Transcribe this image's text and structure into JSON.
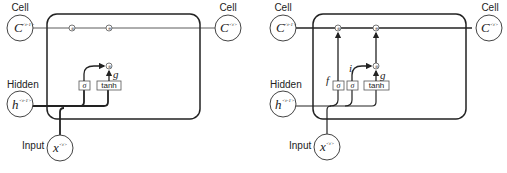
{
  "left_diagram": {
    "title": "Simplified cell (input path only)",
    "cell_in": {
      "label": "Cell",
      "symbol": "C",
      "sup": "<t-1>"
    },
    "cell_out": {
      "label": "Cell",
      "symbol": "C",
      "sup": "<t>"
    },
    "hidden": {
      "label": "Hidden",
      "symbol": "h",
      "sup": "<t-1>"
    },
    "input": {
      "label": "Input",
      "symbol": "x",
      "sup": "<t>"
    },
    "gates": [
      {
        "id": "sigma",
        "label": "σ"
      },
      {
        "id": "tanh",
        "label": "tanh"
      }
    ],
    "g_label": "g",
    "ops": [
      "⊗",
      "⊕",
      "⊗"
    ]
  },
  "right_diagram": {
    "title": "Cell with forget and input gates",
    "cell_in": {
      "label": "Cell",
      "symbol": "C",
      "sup": "<t-1>"
    },
    "cell_out": {
      "label": "Cell",
      "symbol": "C",
      "sup": "<t>"
    },
    "hidden": {
      "label": "Hidden",
      "symbol": "h",
      "sup": "<t-1>"
    },
    "input": {
      "label": "Input",
      "symbol": "x",
      "sup": "<t>"
    },
    "gates": [
      {
        "id": "forget",
        "label": "σ",
        "name": "f"
      },
      {
        "id": "input",
        "label": "σ",
        "name": "i"
      },
      {
        "id": "tanh",
        "label": "tanh",
        "name": "g"
      }
    ],
    "f_label": "f",
    "i_label": "i",
    "g_label": "g",
    "ops": [
      "⊗",
      "⊕",
      "⊗"
    ]
  },
  "colors": {
    "stroke": "#222222",
    "background": "#ffffff",
    "node_fill": "#ffffff"
  }
}
